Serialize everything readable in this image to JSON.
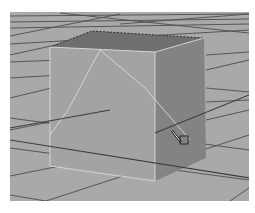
{
  "viewport": {
    "label": "3D perspective viewport",
    "background_color": "#a9a9a9",
    "grid_color": "#4a4a4a"
  },
  "scene": {
    "object": "cube",
    "colors": {
      "front_face": "#a4a4a4",
      "top_face": "#6f6f6f",
      "right_face": "#828282",
      "wireframe_highlight": "#d9d9d9"
    }
  },
  "cursor": {
    "icon": "scale-tool-cursor-icon"
  }
}
